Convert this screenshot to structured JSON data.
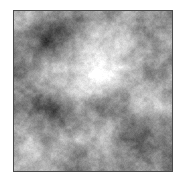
{
  "page": {
    "background_color": "#ffffff"
  },
  "figure": {
    "type": "grayscale-fractal-noise",
    "frame": {
      "left": 13,
      "top": 10,
      "border_color": "#4a4a4a",
      "border_px": 1
    },
    "image": {
      "width": 158,
      "height": 160,
      "base_level": 0.56,
      "darkest_gray": "#3d3d3d",
      "brightest_gray": "#fafafa",
      "seed": 7,
      "grain_amp": 0.05,
      "octaves": [
        {
          "freq": 5,
          "amp": 0.1
        },
        {
          "freq": 10,
          "amp": 0.09
        },
        {
          "freq": 20,
          "amp": 0.07
        },
        {
          "freq": 40,
          "amp": 0.05
        },
        {
          "freq": 80,
          "amp": 0.035
        }
      ],
      "blobs": [
        {
          "x": 36,
          "y": 28,
          "s": 15,
          "a": -0.28,
          "label": "dark-blob-upper-left"
        },
        {
          "x": 8,
          "y": 8,
          "s": 12,
          "a": 0.14,
          "label": "bright-top-left-corner"
        },
        {
          "x": 86,
          "y": 50,
          "s": 24,
          "a": 0.34,
          "label": "bright-center"
        },
        {
          "x": 104,
          "y": 62,
          "s": 14,
          "a": 0.12,
          "label": "bright-center-right-extension"
        },
        {
          "x": 70,
          "y": 20,
          "s": 14,
          "a": -0.1,
          "label": "dark-top-middle-patch"
        },
        {
          "x": 4,
          "y": 56,
          "s": 15,
          "a": -0.12,
          "label": "dark-left-edge-middle"
        },
        {
          "x": 38,
          "y": 98,
          "s": 13,
          "a": -0.3,
          "label": "dark-blob-left-middle"
        },
        {
          "x": 131,
          "y": 60,
          "s": 13,
          "a": -0.09,
          "label": "dark-right-upper-patch"
        },
        {
          "x": 146,
          "y": 90,
          "s": 14,
          "a": 0.12,
          "label": "bright-right-lower"
        },
        {
          "x": 63,
          "y": 75,
          "s": 14,
          "a": 0.1,
          "label": "bright-center-left-patch"
        },
        {
          "x": 121,
          "y": 124,
          "s": 20,
          "a": -0.22,
          "label": "dark-bottom-right"
        },
        {
          "x": 88,
          "y": 126,
          "s": 13,
          "a": 0.22,
          "label": "bright-bottom-center"
        },
        {
          "x": 13,
          "y": 138,
          "s": 13,
          "a": 0.15,
          "label": "bright-bottom-left"
        },
        {
          "x": 160,
          "y": 150,
          "s": 12,
          "a": -0.06,
          "label": "dark-bottom-right-corner"
        }
      ]
    }
  }
}
